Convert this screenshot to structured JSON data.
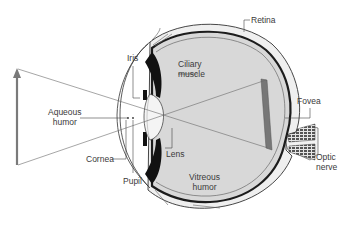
{
  "diagram": {
    "colors": {
      "outline": "#2a2a2a",
      "vitreous_fill": "#dcdcdc",
      "sclera_fill": "#eeeeee",
      "choroid": "#1c1c1c",
      "iris_dark": "#111111",
      "ray_line": "#6a6a6a",
      "arrow": "#7a7a7a",
      "label_text": "#3a3a3a"
    },
    "labels": {
      "retina": "Retina",
      "iris": "Iris",
      "ciliary_muscle_line1": "Ciliary",
      "ciliary_muscle_line2": "muscle",
      "aqueous_humor_line1": "Aqueous",
      "aqueous_humor_line2": "humor",
      "fovea": "Fovea",
      "lens": "Lens",
      "cornea": "Cornea",
      "pupil": "Pupil",
      "vitreous_humor_line1": "Vitreous",
      "vitreous_humor_line2": "humor",
      "optic_nerve_line1": "Optic",
      "optic_nerve_line2": "nerve"
    },
    "object_arrow": {
      "direction": "up",
      "label": ""
    },
    "image_on_retina": {
      "orientation": "inverted"
    }
  }
}
